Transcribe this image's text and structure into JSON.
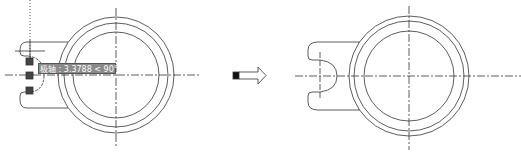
{
  "figure": {
    "before": {
      "tooltip": {
        "label": "极轴",
        "value": "3.3788",
        "angle": "< 90°"
      }
    },
    "arrow": {
      "direction": "right"
    },
    "after": {}
  }
}
